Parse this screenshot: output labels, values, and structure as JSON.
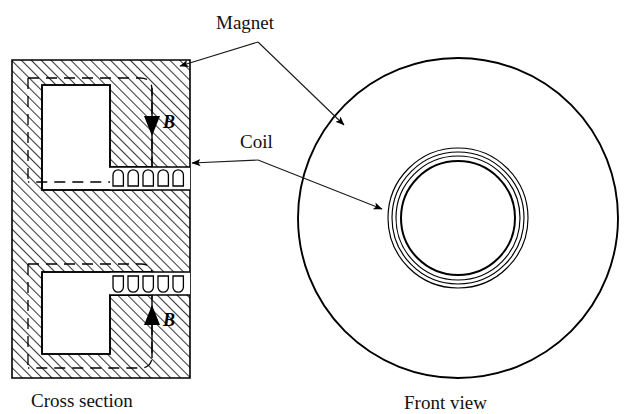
{
  "figure": {
    "labels": {
      "magnet": "Magnet",
      "coil": "Coil",
      "field_upper": "B",
      "field_lower": "B"
    },
    "captions": {
      "left": "Cross section",
      "right": "Front view"
    },
    "colors": {
      "ink": "#000000",
      "leader": "#1a1a1a",
      "background": "#ffffff",
      "hatch": "#3a3a3a"
    },
    "cross_section": {
      "block": {
        "x": 12,
        "y": 60,
        "width": 178,
        "height": 318
      },
      "hatch_angle_deg": 45,
      "hatch_spacing_px": 7,
      "cavity_upper": {
        "x": 42,
        "y": 85,
        "width": 68,
        "height": 82
      },
      "cavity_lower": {
        "x": 42,
        "y": 272,
        "width": 68,
        "height": 82
      },
      "coil_windings_upper": 5,
      "coil_windings_lower": 5,
      "flux_arrow_upper_direction": "down",
      "flux_arrow_lower_direction": "up"
    },
    "front_view": {
      "center": {
        "x": 458,
        "y": 218
      },
      "outer_radius": 160,
      "coil_radii": [
        70,
        66,
        62,
        57
      ],
      "concentric_circle_count": 4
    },
    "leaders": {
      "magnet_vertex": {
        "x": 258,
        "y": 42
      },
      "magnet_target_cross_section": {
        "x": 176,
        "y": 68
      },
      "magnet_target_front_view": {
        "x": 348,
        "y": 128
      },
      "coil_vertex": {
        "x": 258,
        "y": 160
      },
      "coil_target_cross_section": {
        "x": 186,
        "y": 163
      },
      "coil_target_front_view": {
        "x": 386,
        "y": 211
      }
    }
  }
}
